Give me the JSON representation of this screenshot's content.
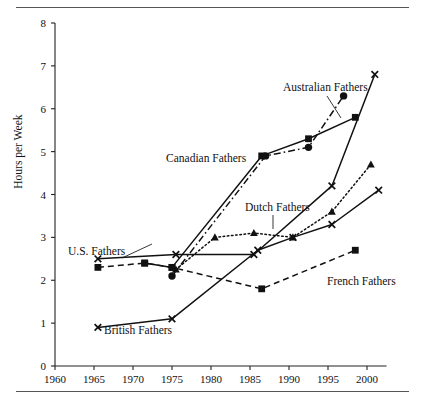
{
  "figure": {
    "has_top_rule": true,
    "has_bottom_rule": true,
    "background": "#ffffff",
    "ink": "#111111"
  },
  "chart_data": {
    "type": "line",
    "title": "",
    "xlabel": "",
    "ylabel": "Hours per Week",
    "xlim": [
      1960,
      2002.5
    ],
    "ylim": [
      0,
      8
    ],
    "xticks": [
      1960,
      1965,
      1970,
      1975,
      1980,
      1985,
      1990,
      1995,
      2000
    ],
    "yticks": [
      0,
      1,
      2,
      3,
      4,
      5,
      6,
      7,
      8
    ],
    "xtick_labels": [
      "1960",
      "1965",
      "1970",
      "1975",
      "1980",
      "1985",
      "1990",
      "1995",
      "2000"
    ],
    "ytick_labels": [
      "0",
      "1",
      "2",
      "3",
      "4",
      "5",
      "6",
      "7",
      "8"
    ],
    "grid": false,
    "legend": "inline-annotations",
    "series": [
      {
        "name": "U.S. Fathers",
        "label": "U.S. Fathers",
        "line_style": "solid",
        "marker": "x",
        "color": "#111111",
        "points": [
          {
            "x": 1965.5,
            "y": 2.5
          },
          {
            "x": 1975.5,
            "y": 2.6
          },
          {
            "x": 1985.5,
            "y": 2.6
          },
          {
            "x": 1995.5,
            "y": 4.2
          },
          {
            "x": 2001.0,
            "y": 6.8
          }
        ]
      },
      {
        "name": "Canadian Fathers",
        "label": "Canadian Fathers",
        "line_style": "solid",
        "marker": "square",
        "color": "#111111",
        "points": [
          {
            "x": 1971.5,
            "y": 2.4
          },
          {
            "x": 1975.0,
            "y": 2.3
          },
          {
            "x": 1986.5,
            "y": 4.9
          },
          {
            "x": 1992.5,
            "y": 5.3
          },
          {
            "x": 1998.5,
            "y": 5.8
          }
        ]
      },
      {
        "name": "Australian Fathers",
        "label": "Australian Fathers",
        "line_style": "dashdot",
        "marker": "circle",
        "color": "#111111",
        "points": [
          {
            "x": 1975.0,
            "y": 2.1
          },
          {
            "x": 1987.0,
            "y": 4.9
          },
          {
            "x": 1992.5,
            "y": 5.1
          },
          {
            "x": 1997.0,
            "y": 6.3
          }
        ]
      },
      {
        "name": "Dutch Fathers",
        "label": "Dutch Fathers",
        "line_style": "dotted",
        "marker": "triangle",
        "color": "#111111",
        "points": [
          {
            "x": 1975.5,
            "y": 2.25
          },
          {
            "x": 1980.5,
            "y": 3.0
          },
          {
            "x": 1985.5,
            "y": 3.1
          },
          {
            "x": 1990.5,
            "y": 3.0
          },
          {
            "x": 1995.5,
            "y": 3.6
          },
          {
            "x": 2000.5,
            "y": 4.7
          }
        ]
      },
      {
        "name": "British Fathers",
        "label": "British Fathers",
        "line_style": "solid",
        "marker": "x",
        "color": "#111111",
        "points": [
          {
            "x": 1965.5,
            "y": 0.9
          },
          {
            "x": 1975.0,
            "y": 1.1
          },
          {
            "x": 1986.0,
            "y": 2.7
          },
          {
            "x": 1990.5,
            "y": 3.0
          },
          {
            "x": 1995.5,
            "y": 3.3
          },
          {
            "x": 2001.5,
            "y": 4.1
          }
        ]
      },
      {
        "name": "French Fathers",
        "label": "French Fathers",
        "line_style": "dashed",
        "marker": "square",
        "color": "#111111",
        "points": [
          {
            "x": 1965.5,
            "y": 2.3
          },
          {
            "x": 1971.5,
            "y": 2.4
          },
          {
            "x": 1975.0,
            "y": 2.3
          },
          {
            "x": 1986.5,
            "y": 1.8
          },
          {
            "x": 1998.5,
            "y": 2.7
          }
        ]
      }
    ],
    "annotations": [
      {
        "name": "us-fathers-label",
        "text": "U.S. Fathers",
        "x": 68,
        "y": 255,
        "leader": [
          [
            122,
            258
          ],
          [
            152,
            244
          ]
        ]
      },
      {
        "name": "canadian-fathers-label",
        "text": "Canadian Fathers",
        "x": 166,
        "y": 162,
        "leader": null
      },
      {
        "name": "australian-fathers-label",
        "text": "Australian Fathers",
        "x": 283,
        "y": 91,
        "leader": [
          [
            327,
            96
          ],
          [
            341,
            118
          ]
        ]
      },
      {
        "name": "dutch-fathers-label",
        "text": "Dutch Fathers",
        "x": 245,
        "y": 211,
        "leader": [
          [
            273,
            215
          ],
          [
            273,
            229
          ]
        ]
      },
      {
        "name": "british-fathers-label",
        "text": "British Fathers",
        "x": 104,
        "y": 334,
        "leader": null
      },
      {
        "name": "french-fathers-label",
        "text": "French Fathers",
        "x": 327,
        "y": 285,
        "leader": null
      }
    ]
  }
}
